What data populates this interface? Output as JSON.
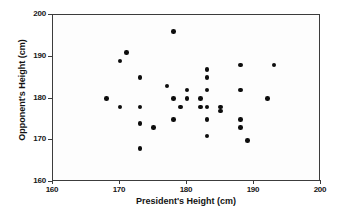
{
  "chart_data": {
    "type": "scatter",
    "title": "",
    "xlabel": "President's Height (cm)",
    "ylabel": "Opponent's Height (cm)",
    "xlim": [
      160,
      200
    ],
    "ylim": [
      160,
      200
    ],
    "xticks": [
      160,
      170,
      180,
      190,
      200
    ],
    "yticks": [
      160,
      170,
      180,
      190,
      200
    ],
    "grid": false,
    "legend": null,
    "marker": {
      "shape": "circle",
      "color": "#0d0d0d",
      "size": 4.6
    },
    "series": [
      {
        "name": "President vs Opponent height",
        "x": [
          168,
          170,
          170,
          171,
          173,
          173,
          173,
          173,
          175,
          177,
          178,
          178,
          178,
          179,
          180,
          180,
          182,
          182,
          183,
          183,
          183,
          183,
          183,
          183,
          185,
          185,
          188,
          188,
          188,
          188,
          189,
          192,
          193
        ],
        "y": [
          180,
          189,
          178,
          191,
          185,
          178,
          174,
          168,
          173,
          183,
          196,
          180,
          175,
          178,
          182,
          180,
          180,
          178,
          187,
          185,
          182,
          178,
          175,
          171,
          177,
          178,
          188,
          182,
          175,
          173,
          170,
          180,
          188
        ]
      }
    ],
    "n_points": 33
  }
}
